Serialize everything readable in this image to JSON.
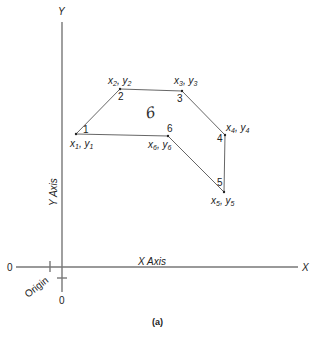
{
  "diagram": {
    "caption": "(a)",
    "axes": {
      "y_label": "Y",
      "y_axis_label": "Y Axis",
      "x_label": "X",
      "x_axis_label": "X Axis",
      "origin_label": "Origin",
      "x_zero": "0",
      "y_zero": "0"
    },
    "polygon": {
      "side_count_label": "6",
      "vertices": [
        {
          "index": "1",
          "coord_x": "x",
          "coord_y": "y",
          "sub": "1"
        },
        {
          "index": "2",
          "coord_x": "x",
          "coord_y": "y",
          "sub": "2"
        },
        {
          "index": "3",
          "coord_x": "x",
          "coord_y": "y",
          "sub": "3"
        },
        {
          "index": "4",
          "coord_x": "x",
          "coord_y": "y",
          "sub": "4"
        },
        {
          "index": "5",
          "coord_x": "x",
          "coord_y": "y",
          "sub": "5"
        },
        {
          "index": "6",
          "coord_x": "x",
          "coord_y": "y",
          "sub": "6"
        }
      ]
    },
    "colors": {
      "axis": "#777777",
      "edge": "#555555",
      "text": "#222222",
      "background": "#ffffff"
    }
  }
}
